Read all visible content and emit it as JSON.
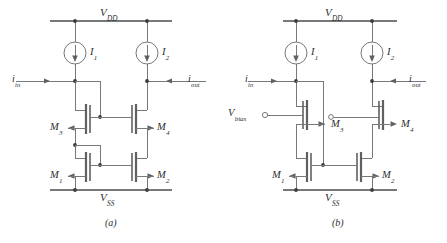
{
  "figure": {
    "kind": "schematic-pair",
    "subfigures": [
      {
        "id": "a",
        "caption": "(a)",
        "rails": {
          "top": "V",
          "top_sub": "DD",
          "bottom": "V",
          "bottom_sub": "SS"
        },
        "sources": [
          {
            "name": "current-source-1",
            "label": "I",
            "sub": "1",
            "direction": "down"
          },
          {
            "name": "current-source-2",
            "label": "I",
            "sub": "2",
            "direction": "down"
          }
        ],
        "ports": [
          {
            "name": "input-port",
            "label": "i",
            "sub": "in",
            "direction": "right"
          },
          {
            "name": "output-port",
            "label": "i",
            "sub": "out",
            "direction": "left"
          }
        ],
        "transistors": [
          {
            "name": "M",
            "sub": "1",
            "arrow": "left",
            "position": "bottom-left"
          },
          {
            "name": "M",
            "sub": "2",
            "arrow": "right",
            "position": "bottom-right"
          },
          {
            "name": "M",
            "sub": "3",
            "arrow": "left",
            "position": "top-left"
          },
          {
            "name": "M",
            "sub": "4",
            "arrow": "right",
            "position": "top-right"
          }
        ]
      },
      {
        "id": "b",
        "caption": "(b)",
        "rails": {
          "top": "V",
          "top_sub": "DD",
          "bottom": "V",
          "bottom_sub": "SS"
        },
        "sources": [
          {
            "name": "current-source-1",
            "label": "I",
            "sub": "1",
            "direction": "down"
          },
          {
            "name": "current-source-2",
            "label": "I",
            "sub": "2",
            "direction": "down"
          }
        ],
        "ports": [
          {
            "name": "input-port",
            "label": "i",
            "sub": "in",
            "direction": "right"
          },
          {
            "name": "output-port",
            "label": "i",
            "sub": "out",
            "direction": "left"
          },
          {
            "name": "bias-port",
            "label": "V",
            "sub": "bias",
            "terminal": "open-circle"
          }
        ],
        "transistors": [
          {
            "name": "M",
            "sub": "1",
            "arrow": "left",
            "position": "bottom-left"
          },
          {
            "name": "M",
            "sub": "2",
            "arrow": "right",
            "position": "bottom-right"
          },
          {
            "name": "M",
            "sub": "3",
            "arrow": "right",
            "position": "top-left"
          },
          {
            "name": "M",
            "sub": "4",
            "arrow": "right",
            "position": "top-right"
          }
        ]
      }
    ]
  },
  "colors": {
    "wire": "#76787a",
    "device": "#5e6063",
    "text": "#2b2d2f",
    "background": "#ffffff"
  }
}
